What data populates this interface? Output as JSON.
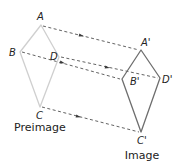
{
  "diagram": {
    "type": "translation",
    "colors": {
      "preimage_stroke": "#cfcfcf",
      "image_stroke": "#6e6e6e",
      "arrow": "#3a3a3a",
      "text": "#222222"
    },
    "preimage": {
      "caption": "Preimage",
      "vertices": [
        {
          "name": "A",
          "label": "A",
          "x": 41,
          "y": 25
        },
        {
          "name": "B",
          "label": "B",
          "x": 20,
          "y": 52
        },
        {
          "name": "C",
          "label": "C",
          "x": 40,
          "y": 107
        },
        {
          "name": "D",
          "label": "D",
          "x": 59,
          "y": 57
        }
      ]
    },
    "image": {
      "caption": "Image",
      "vertices": [
        {
          "name": "A'",
          "label": "A'",
          "x": 141,
          "y": 50
        },
        {
          "name": "B'",
          "label": "B'",
          "x": 122,
          "y": 79
        },
        {
          "name": "C'",
          "label": "C'",
          "x": 141,
          "y": 132
        },
        {
          "name": "D'",
          "label": "D'",
          "x": 160,
          "y": 78
        }
      ]
    },
    "translation_arrows": [
      {
        "from": "A",
        "to": "A'"
      },
      {
        "from": "B",
        "to": "B'"
      },
      {
        "from": "D",
        "to": "D'"
      },
      {
        "from": "C",
        "to": "C'"
      }
    ]
  }
}
